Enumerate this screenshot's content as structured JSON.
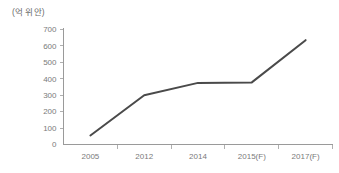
{
  "unit_label": "(억 위안)",
  "colors": {
    "line": "#4a4a4a",
    "axis": "#9a9a9a",
    "tick": "#b0b0b0",
    "label_text": "#7a7a7a",
    "background": "#ffffff"
  },
  "chart_data": {
    "type": "line",
    "title": "",
    "subtitle": "",
    "xlabel": "",
    "ylabel": "(억 위안)",
    "categories": [
      "2005",
      "2012",
      "2014",
      "2015(F)",
      "2017(F)"
    ],
    "values": [
      55,
      300,
      375,
      378,
      635
    ],
    "series": [
      {
        "name": "",
        "values": [
          55,
          300,
          375,
          378,
          635
        ],
        "color": "#4a4a4a"
      }
    ],
    "ylim": [
      0,
      700
    ],
    "ytick_labels": [
      "0",
      "100",
      "200",
      "300",
      "400",
      "500",
      "600",
      "700"
    ],
    "ytick_values": [
      0,
      100,
      200,
      300,
      400,
      500,
      600,
      700
    ],
    "xtick_labels": [
      "2005",
      "2012",
      "2014",
      "2015(F)",
      "2017(F)"
    ],
    "grid": false,
    "legend": false,
    "legend_position": "none",
    "markers": false,
    "annotations": []
  }
}
